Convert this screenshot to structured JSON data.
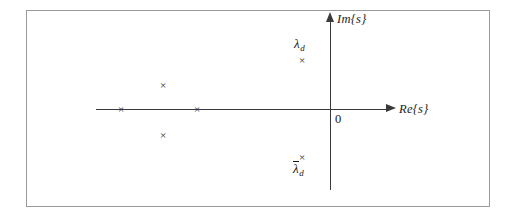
{
  "figure": {
    "title": "",
    "background_color": "#ffffff",
    "frame_color": "#9a9a9a",
    "axis_color": "#3a3a3a",
    "marker_color": "#2b2b2b"
  },
  "axes": {
    "real": {
      "label": "Re{s}",
      "arrow": "right-arrowhead"
    },
    "imaginary": {
      "label": "Im{s}",
      "arrow": "up-arrowhead"
    },
    "origin": {
      "label": "0"
    }
  },
  "labels": {
    "lambda_d": {
      "base": "λ",
      "subscript": "d",
      "overbar": false
    },
    "lambda_d_conjugate": {
      "base": "λ",
      "subscript": "d",
      "overbar": true
    }
  },
  "chart_data": {
    "type": "scatter",
    "title": "",
    "xlabel": "Re{s}",
    "ylabel": "Im{s}",
    "marker": "x",
    "grid": false,
    "legend": null,
    "annotations": [
      {
        "text": "λ_d",
        "x": 302,
        "y": 45
      },
      {
        "text": "λ̄_d",
        "x": 302,
        "y": 168
      },
      {
        "text": "0",
        "x": 338,
        "y": 118
      }
    ],
    "series": [
      {
        "name": "open-loop poles",
        "points": [
          {
            "px": 121,
            "py": 109,
            "re": -4.0,
            "im": 0.0
          },
          {
            "px": 197,
            "py": 109,
            "re": -2.4,
            "im": 0.0
          },
          {
            "px": 163,
            "py": 85,
            "re": -3.1,
            "im": 0.5
          },
          {
            "px": 163,
            "py": 135,
            "re": -3.1,
            "im": -0.5
          }
        ]
      },
      {
        "name": "desired poles",
        "points": [
          {
            "px": 302,
            "py": 60,
            "re": -0.6,
            "im": 1.0
          },
          {
            "px": 302,
            "py": 157,
            "re": -0.6,
            "im": -1.0
          }
        ]
      }
    ]
  },
  "poles": [
    {
      "id": "pole-real-1",
      "glyph": "×",
      "left": 121,
      "top": 109
    },
    {
      "id": "pole-real-2",
      "glyph": "×",
      "left": 197,
      "top": 109
    },
    {
      "id": "pole-complex-1",
      "glyph": "×",
      "left": 163,
      "top": 85
    },
    {
      "id": "pole-complex-2",
      "glyph": "×",
      "left": 163,
      "top": 135
    },
    {
      "id": "pole-desired-1",
      "glyph": "×",
      "left": 302,
      "top": 60
    },
    {
      "id": "pole-desired-2",
      "glyph": "×",
      "left": 302,
      "top": 157
    }
  ]
}
